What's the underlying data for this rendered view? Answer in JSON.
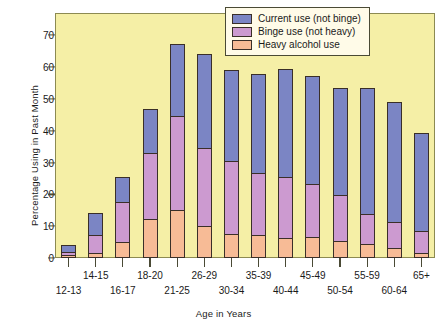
{
  "chart_data": {
    "type": "bar",
    "subtype": "stacked-bar",
    "title": "",
    "xlabel": "Age in Years",
    "ylabel": "Percentage Using in Past Month",
    "ylim": [
      0,
      77
    ],
    "yticks": [
      0,
      10,
      20,
      30,
      40,
      50,
      60,
      70
    ],
    "grid": false,
    "legend_position": "top-right",
    "categories": [
      "12-13",
      "14-15",
      "16-17",
      "18-20",
      "21-25",
      "26-29",
      "30-34",
      "35-39",
      "40-44",
      "45-49",
      "50-54",
      "55-59",
      "60-64",
      "65+"
    ],
    "series": [
      {
        "name": "Heavy alcohol use",
        "color": "#f7bb96",
        "values": [
          1.0,
          1.6,
          5.0,
          12.2,
          15.1,
          10.1,
          7.6,
          7.1,
          6.3,
          6.7,
          5.2,
          4.5,
          3.0,
          1.7
        ]
      },
      {
        "name": "Binge use (not heavy)",
        "color": "#cc9ad0",
        "values": [
          1.2,
          5.9,
          12.9,
          21.3,
          30.0,
          24.9,
          23.1,
          20.0,
          19.6,
          16.8,
          15.0,
          9.6,
          8.8,
          7.1
        ]
      },
      {
        "name": "Current use (not binge)",
        "color": "#7b85c4",
        "values": [
          2.7,
          7.4,
          8.1,
          13.9,
          23.0,
          29.7,
          29.2,
          31.4,
          34.1,
          34.5,
          33.8,
          39.9,
          38.0,
          31.3
        ]
      }
    ],
    "totals": [
      4.9,
      14.9,
      26.0,
      47.4,
      68.1,
      64.7,
      59.9,
      58.5,
      60.0,
      58.0,
      54.0,
      54.0,
      49.8,
      40.1
    ]
  },
  "legend": {
    "items": [
      {
        "label": "Current use (not binge)",
        "swatch": "current"
      },
      {
        "label": "Binge use (not heavy)",
        "swatch": "binge"
      },
      {
        "label": "Heavy alcohol use",
        "swatch": "heavy"
      }
    ]
  },
  "colors": {
    "current_use": "#7b85c4",
    "binge_use": "#cc9ad0",
    "heavy_use": "#f7bb96",
    "plot_background": "#f5efa6",
    "legend_background": "#fffbe8",
    "axis": "#4a4a35"
  }
}
